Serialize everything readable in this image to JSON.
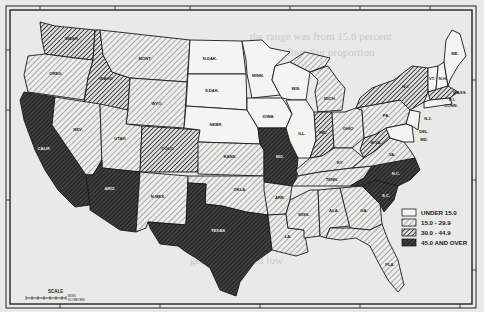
{
  "map": {
    "type": "choropleth",
    "region": "United States (48 states)",
    "categories": [
      {
        "id": "c0",
        "label": "UNDER 15.0",
        "fill": "#f4f4f2",
        "pattern": "none"
      },
      {
        "id": "c1",
        "label": "15.0 - 29.9",
        "fill": "#dcdcda",
        "pattern": "hatch-light"
      },
      {
        "id": "c2",
        "label": "30.0 - 44.9",
        "fill": "#9a9a98",
        "pattern": "hatch-medium"
      },
      {
        "id": "c3",
        "label": "45.0 AND OVER",
        "fill": "#3a3a3a",
        "pattern": "hatch-dense"
      }
    ],
    "states": [
      {
        "abbr": "WASH",
        "cat": "c2"
      },
      {
        "abbr": "OREG",
        "cat": "c1"
      },
      {
        "abbr": "CALIF",
        "cat": "c3"
      },
      {
        "abbr": "IDAHO",
        "cat": "c2"
      },
      {
        "abbr": "NEV",
        "cat": "c1"
      },
      {
        "abbr": "MONT",
        "cat": "c1"
      },
      {
        "abbr": "WYO",
        "cat": "c1"
      },
      {
        "abbr": "UTAH",
        "cat": "c1"
      },
      {
        "abbr": "ARIZ",
        "cat": "c3"
      },
      {
        "abbr": "COLO",
        "cat": "c2"
      },
      {
        "abbr": "N.MEX",
        "cat": "c1"
      },
      {
        "abbr": "N.DAK",
        "cat": "c0"
      },
      {
        "abbr": "S.DAK",
        "cat": "c0"
      },
      {
        "abbr": "NEBR",
        "cat": "c0"
      },
      {
        "abbr": "KANS",
        "cat": "c1"
      },
      {
        "abbr": "OKLA",
        "cat": "c1"
      },
      {
        "abbr": "TEXAS",
        "cat": "c3"
      },
      {
        "abbr": "MINN",
        "cat": "c0"
      },
      {
        "abbr": "IOWA",
        "cat": "c0"
      },
      {
        "abbr": "MO",
        "cat": "c3"
      },
      {
        "abbr": "ARK",
        "cat": "c1"
      },
      {
        "abbr": "LA",
        "cat": "c1"
      },
      {
        "abbr": "WIS",
        "cat": "c0"
      },
      {
        "abbr": "ILL",
        "cat": "c0"
      },
      {
        "abbr": "MICH",
        "cat": "c1"
      },
      {
        "abbr": "IND",
        "cat": "c2"
      },
      {
        "abbr": "OHIO",
        "cat": "c1"
      },
      {
        "abbr": "KY",
        "cat": "c1"
      },
      {
        "abbr": "TENN",
        "cat": "c1"
      },
      {
        "abbr": "MISS",
        "cat": "c1"
      },
      {
        "abbr": "ALA",
        "cat": "c1"
      },
      {
        "abbr": "GA",
        "cat": "c1"
      },
      {
        "abbr": "FLA",
        "cat": "c1"
      },
      {
        "abbr": "S.C",
        "cat": "c3"
      },
      {
        "abbr": "N.C",
        "cat": "c3"
      },
      {
        "abbr": "VA",
        "cat": "c1"
      },
      {
        "abbr": "W.VA",
        "cat": "c2"
      },
      {
        "abbr": "PA",
        "cat": "c1"
      },
      {
        "abbr": "N.Y",
        "cat": "c2"
      },
      {
        "abbr": "N.J",
        "cat": "c0"
      },
      {
        "abbr": "DEL",
        "cat": "c0"
      },
      {
        "abbr": "MD",
        "cat": "c0"
      },
      {
        "abbr": "VT",
        "cat": "c0"
      },
      {
        "abbr": "N.H",
        "cat": "c0"
      },
      {
        "abbr": "ME",
        "cat": "c0"
      },
      {
        "abbr": "MASS",
        "cat": "c1"
      },
      {
        "abbr": "R.I",
        "cat": "c0"
      },
      {
        "abbr": "CONN",
        "cat": "c0"
      }
    ]
  },
  "legend": {
    "items": [
      "UNDER 15.0",
      "15.0 - 29.9",
      "30.0 - 44.9",
      "45.0 AND OVER"
    ]
  },
  "scale": {
    "title": "SCALE",
    "units_top": "MILES",
    "units_bottom": "KILOMETERS"
  },
  "labels": {
    "WASH": "WASH.",
    "OREG": "OREG.",
    "CALIF": "CALIF.",
    "IDAHO": "IDAHO",
    "NEV": "NEV.",
    "MONT": "MONT.",
    "WYO": "WYO.",
    "UTAH": "UTAH",
    "ARIZ": "ARIZ.",
    "COLO": "COLO.",
    "NMEX": "N.MEX.",
    "NDAK": "N.DAK.",
    "SDAK": "S.DAK.",
    "NEBR": "NEBR.",
    "KANS": "KANS.",
    "OKLA": "OKLA.",
    "TEXAS": "TEXAS",
    "MINN": "MINN.",
    "IOWA": "IOWA",
    "MO": "MO.",
    "ARK": "ARK.",
    "LA": "LA.",
    "WIS": "WIS.",
    "ILL": "ILL.",
    "MICH": "MICH.",
    "IND": "IND.",
    "OHIO": "OHIO",
    "KY": "KY.",
    "TENN": "TENN.",
    "MISS": "MISS.",
    "ALA": "ALA.",
    "GA": "GA.",
    "FLA": "FLA.",
    "SC": "S.C.",
    "NC": "N.C.",
    "VA": "VA.",
    "WVA": "W.VA.",
    "PA": "PA.",
    "NY": "N.Y.",
    "NJ": "N.J.",
    "DEL": "DEL.",
    "MD": "MD.",
    "VT": "VT.",
    "NH": "N.H.",
    "ME": "ME.",
    "MASS": "MASS.",
    "RI": "R.I.",
    "CONN": "CONN."
  }
}
